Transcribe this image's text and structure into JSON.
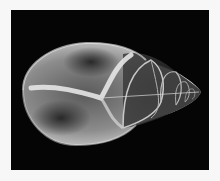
{
  "image": {
    "subject": "X-ray of a spiral sea shell",
    "background_color": "#050505",
    "border_color": "#f7f7f7",
    "shell_highlight_color": "#e8e8e8"
  }
}
